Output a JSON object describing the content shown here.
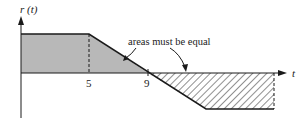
{
  "diagram": {
    "y_axis_label": "r (t)",
    "x_axis_label": "t",
    "tick_labels": [
      "5",
      "9"
    ],
    "annotation": "areas must be equal",
    "colors": {
      "line": "#1a1a1a",
      "gray_fill": "#b8b8b8",
      "hatch": "#333333",
      "background": "#ffffff"
    },
    "geometry": {
      "axis_origin_x": 21,
      "axis_y": 73,
      "top_level_y": 34,
      "bottom_level_y": 109,
      "tick_5_x": 89,
      "tick_9_x": 148,
      "ramp_end_x": 206,
      "right_edge_x": 274
    }
  }
}
